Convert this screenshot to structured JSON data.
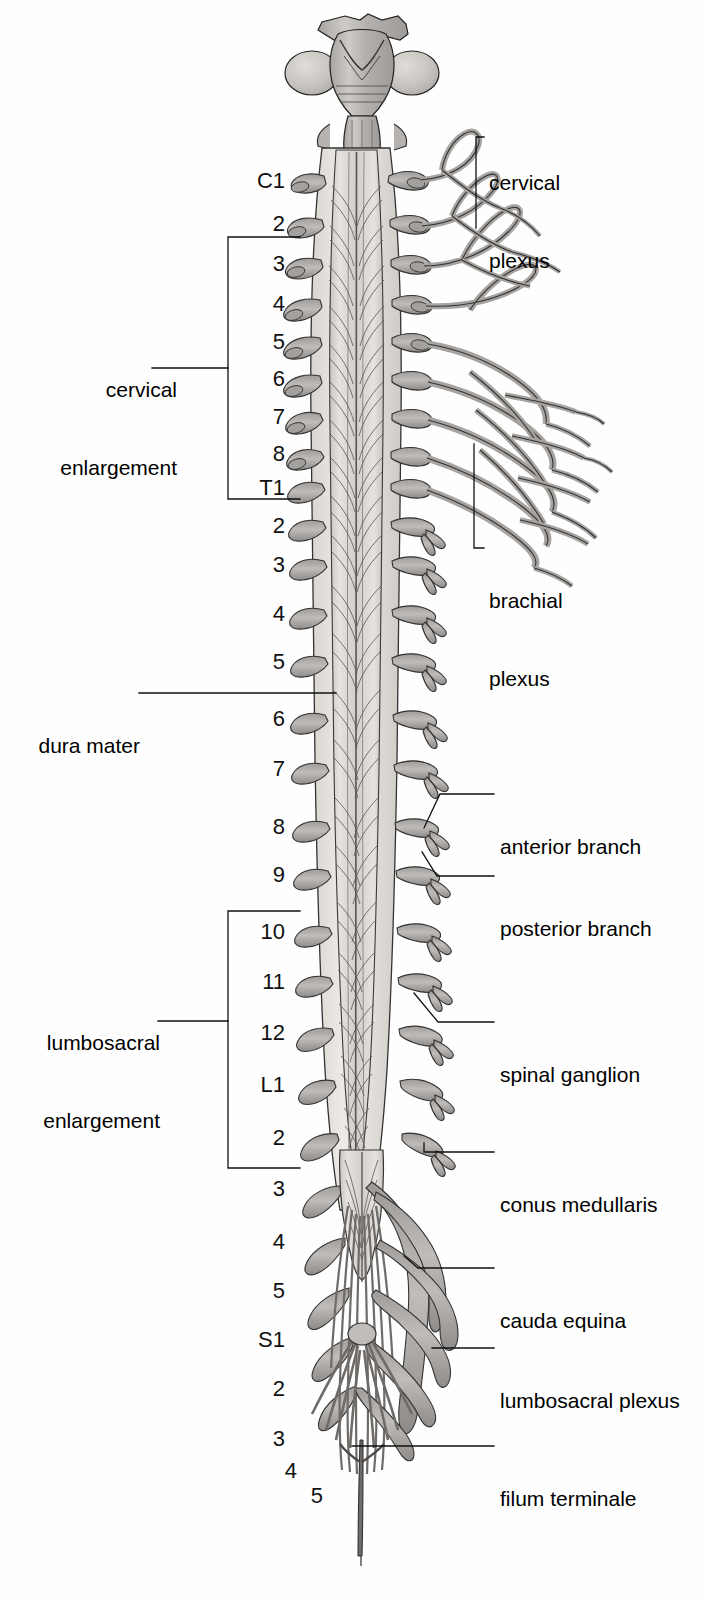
{
  "figure": {
    "background_color": "#ffffff",
    "ink_color": "#1a1a1a",
    "tissue_fill": "#b9b6b4",
    "cord_fill": "#dedbd7",
    "width": 707,
    "height": 1602
  },
  "segment_labels": [
    {
      "text": "C1",
      "x": 285,
      "y": 182
    },
    {
      "text": "2",
      "x": 285,
      "y": 225
    },
    {
      "text": "3",
      "x": 285,
      "y": 265
    },
    {
      "text": "4",
      "x": 285,
      "y": 305
    },
    {
      "text": "5",
      "x": 285,
      "y": 343
    },
    {
      "text": "6",
      "x": 285,
      "y": 380
    },
    {
      "text": "7",
      "x": 285,
      "y": 418
    },
    {
      "text": "8",
      "x": 285,
      "y": 455
    },
    {
      "text": "T1",
      "x": 285,
      "y": 489
    },
    {
      "text": "2",
      "x": 285,
      "y": 527
    },
    {
      "text": "3",
      "x": 285,
      "y": 566
    },
    {
      "text": "4",
      "x": 285,
      "y": 615
    },
    {
      "text": "5",
      "x": 285,
      "y": 663
    },
    {
      "text": "6",
      "x": 285,
      "y": 720
    },
    {
      "text": "7",
      "x": 285,
      "y": 770
    },
    {
      "text": "8",
      "x": 285,
      "y": 828
    },
    {
      "text": "9",
      "x": 285,
      "y": 876
    },
    {
      "text": "10",
      "x": 285,
      "y": 933
    },
    {
      "text": "11",
      "x": 285,
      "y": 983
    },
    {
      "text": "12",
      "x": 285,
      "y": 1034
    },
    {
      "text": "L1",
      "x": 285,
      "y": 1086
    },
    {
      "text": "2",
      "x": 285,
      "y": 1139
    },
    {
      "text": "3",
      "x": 285,
      "y": 1190
    },
    {
      "text": "4",
      "x": 285,
      "y": 1243
    },
    {
      "text": "5",
      "x": 285,
      "y": 1292
    },
    {
      "text": "S1",
      "x": 285,
      "y": 1341
    },
    {
      "text": "2",
      "x": 285,
      "y": 1390
    },
    {
      "text": "3",
      "x": 285,
      "y": 1440
    },
    {
      "text": "4",
      "x": 297,
      "y": 1472
    },
    {
      "text": "5",
      "x": 323,
      "y": 1497
    }
  ],
  "left_labels": [
    {
      "name": "cervical-enlargement",
      "lines": [
        "cervical",
        "enlargement"
      ],
      "x": 32,
      "y": 325,
      "bracket": {
        "top": 237,
        "bottom": 499,
        "x": 228,
        "stem_y": 368,
        "stem_x1": 152,
        "stem_x2": 228,
        "tick": 300
      }
    },
    {
      "name": "dura-mater",
      "lines": [
        "dura mater"
      ],
      "x": 32,
      "y": 682,
      "leader": {
        "x1": 139,
        "y1": 693,
        "x2": 336,
        "y2": 693
      }
    },
    {
      "name": "lumbosacral-enlargement",
      "lines": [
        "lumbosacral",
        "enlargement"
      ],
      "x": 32,
      "y": 978,
      "bracket": {
        "top": 911,
        "bottom": 1168,
        "x": 228,
        "stem_y": 1021,
        "stem_x1": 158,
        "stem_x2": 228,
        "tick": 300
      }
    }
  ],
  "right_labels": [
    {
      "name": "cervical-plexus",
      "lines": [
        "cervical",
        "plexus"
      ],
      "x": 489,
      "y": 118,
      "leader": [
        [
          475,
          137
        ],
        [
          476,
          137
        ],
        [
          476,
          140
        ],
        [
          476,
          225
        ]
      ],
      "hook": {
        "x1": 455,
        "y1": 137,
        "x2": 489,
        "y2": 137
      }
    },
    {
      "name": "brachial-plexus",
      "lines": [
        "brachial",
        "plexus"
      ],
      "x": 489,
      "y": 536,
      "leader": [
        [
          474,
          548
        ],
        [
          474,
          448
        ]
      ],
      "hook": {
        "x1": 455,
        "y1": 548,
        "x2": 489,
        "y2": 548
      }
    },
    {
      "name": "anterior-branch",
      "lines": [
        "anterior branch"
      ],
      "x": 500,
      "y": 783,
      "leader": [
        [
          455,
          794
        ],
        [
          437,
          794
        ],
        [
          425,
          830
        ]
      ],
      "hook": null
    },
    {
      "name": "posterior-branch",
      "lines": [
        "posterior branch"
      ],
      "x": 500,
      "y": 845,
      "leader": [
        [
          455,
          876
        ],
        [
          437,
          876
        ],
        [
          420,
          855
        ]
      ],
      "hook": null
    },
    {
      "name": "spinal-ganglion",
      "lines": [
        "spinal ganglion"
      ],
      "x": 500,
      "y": 1011,
      "leader": [
        [
          490,
          1022
        ],
        [
          437,
          1022
        ],
        [
          415,
          995
        ]
      ],
      "hook": null
    },
    {
      "name": "conus-medullaris",
      "lines": [
        "conus medullaris"
      ],
      "x": 500,
      "y": 1141,
      "leader": [
        [
          490,
          1152
        ],
        [
          424,
          1152
        ],
        [
          424,
          1142
        ]
      ],
      "hook": null
    },
    {
      "name": "cauda-equina",
      "lines": [
        "cauda equina"
      ],
      "x": 500,
      "y": 1257,
      "leader": [
        [
          490,
          1268
        ],
        [
          418,
          1268
        ],
        [
          405,
          1258
        ]
      ],
      "hook": null
    },
    {
      "name": "lumbosacral-plexus",
      "lines": [
        "lumbosacral plexus"
      ],
      "x": 500,
      "y": 1337,
      "leader": [
        [
          490,
          1348
        ],
        [
          437,
          1348
        ]
      ],
      "hook": null
    },
    {
      "name": "filum-terminale",
      "lines": [
        "filum terminale"
      ],
      "x": 500,
      "y": 1435,
      "leader": [
        [
          490,
          1446
        ],
        [
          355,
          1446
        ]
      ],
      "hook": null
    }
  ],
  "anatomy_parts": {
    "brainstem": "brainstem with cerebellar hemispheres",
    "cord": "spinal cord",
    "dura": "dura mater sheath",
    "roots": "spinal nerve roots",
    "ganglia": "spinal ganglia",
    "filum": "filum terminale"
  }
}
